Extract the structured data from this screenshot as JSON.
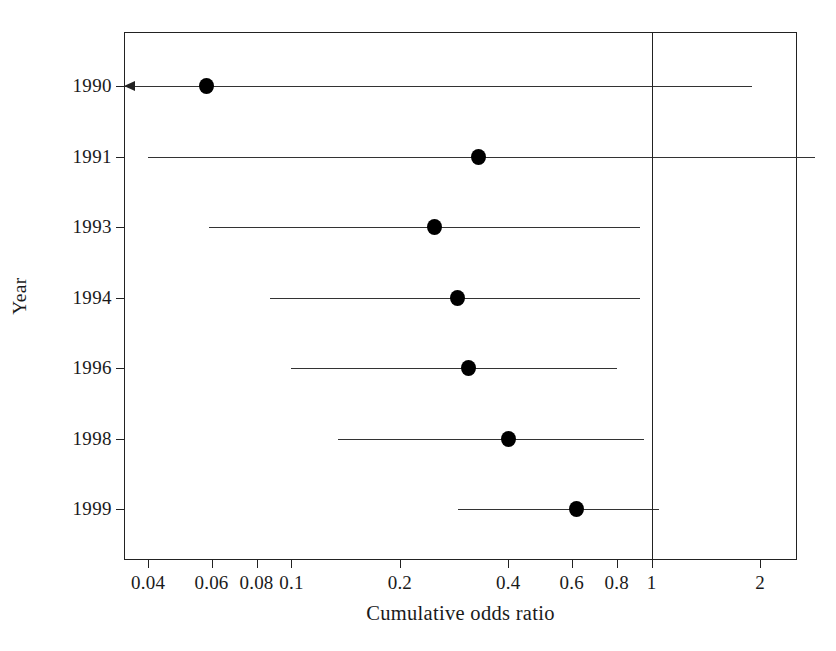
{
  "chart_data": {
    "type": "scatter",
    "subtype": "forest-plot-cumulative-meta-analysis",
    "title": "",
    "xlabel": "Cumulative odds ratio",
    "ylabel": "Year",
    "xscale": "log",
    "xlim": [
      0.0345,
      2.55
    ],
    "grid": false,
    "legend": null,
    "reference_line": {
      "value": 1,
      "label": "1",
      "orientation": "vertical"
    },
    "xticks": [
      {
        "value": 0.04,
        "label": "0.04"
      },
      {
        "value": 0.06,
        "label": "0.06"
      },
      {
        "value": 0.08,
        "label": "0.08"
      },
      {
        "value": 0.1,
        "label": "0.1"
      },
      {
        "value": 0.2,
        "label": "0.2"
      },
      {
        "value": 0.4,
        "label": "0.4"
      },
      {
        "value": 0.6,
        "label": "0.6"
      },
      {
        "value": 0.8,
        "label": "0.8"
      },
      {
        "value": 1,
        "label": "1"
      },
      {
        "value": 2,
        "label": "2"
      }
    ],
    "categories": [
      "1990",
      "1991",
      "1993",
      "1994",
      "1996",
      "1998",
      "1999"
    ],
    "values": [
      0.058,
      0.33,
      0.25,
      0.29,
      0.31,
      0.4,
      0.62
    ],
    "rows": [
      {
        "label": "1990",
        "odds_ratio": 0.058,
        "ci_low": 0.0345,
        "ci_high": 1.9,
        "ci_low_truncated": true,
        "ci_high_truncated": false
      },
      {
        "label": "1991",
        "odds_ratio": 0.33,
        "ci_low": 0.04,
        "ci_high": 2.85,
        "ci_low_truncated": false,
        "ci_high_truncated": false
      },
      {
        "label": "1993",
        "odds_ratio": 0.25,
        "ci_low": 0.059,
        "ci_high": 0.93,
        "ci_low_truncated": false,
        "ci_high_truncated": false
      },
      {
        "label": "1994",
        "odds_ratio": 0.29,
        "ci_low": 0.087,
        "ci_high": 0.93,
        "ci_low_truncated": false,
        "ci_high_truncated": false
      },
      {
        "label": "1996",
        "odds_ratio": 0.31,
        "ci_low": 0.1,
        "ci_high": 0.8,
        "ci_low_truncated": false,
        "ci_high_truncated": false
      },
      {
        "label": "1998",
        "odds_ratio": 0.4,
        "ci_low": 0.135,
        "ci_high": 0.95,
        "ci_low_truncated": false,
        "ci_high_truncated": false
      },
      {
        "label": "1999",
        "odds_ratio": 0.62,
        "ci_low": 0.29,
        "ci_high": 1.05,
        "ci_low_truncated": false,
        "ci_high_truncated": false
      }
    ]
  },
  "colors": {
    "marker": "#000000",
    "line": "#333333",
    "axis": "#222222",
    "background": "#ffffff"
  }
}
